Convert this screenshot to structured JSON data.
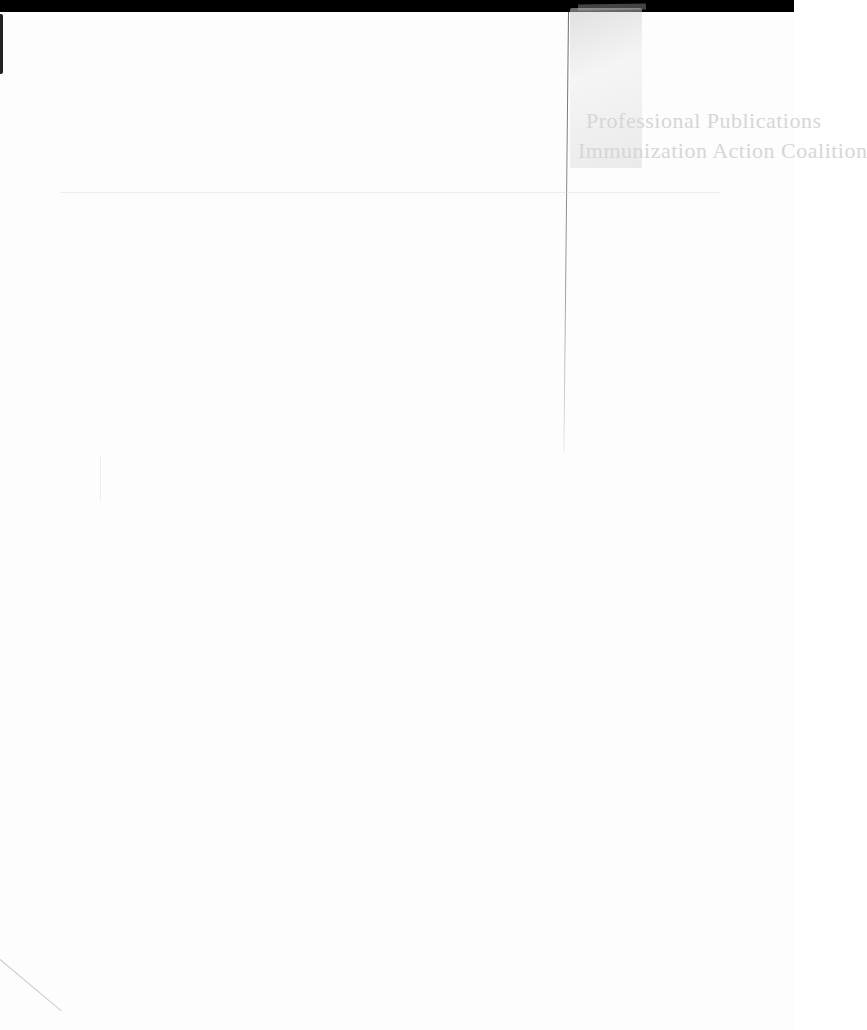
{
  "document": {
    "type": "scanned page",
    "heading": {
      "line1": "Professional Publications",
      "line2": "Immunization Action Coalition"
    },
    "colors": {
      "background": "#fdfdfd",
      "heading_text": "#d6d6d6",
      "top_bar": "#000000"
    }
  }
}
